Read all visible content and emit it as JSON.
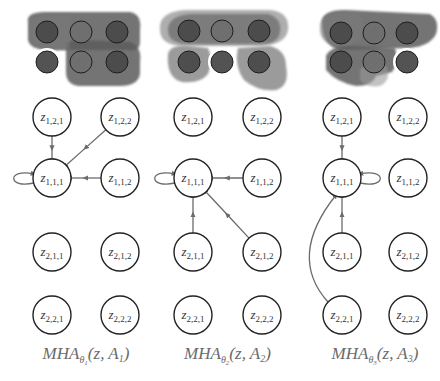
{
  "colors": {
    "blob_dark": "#5c5c5c",
    "blob_mid": "#7a7a7a",
    "blob_light": "#9a9a9a",
    "dot_dark": "#4a4a4a",
    "dot_mid": "#6f6f6f",
    "edge": "#6b6b6b",
    "node_stroke": "#222222",
    "caption": "#6a6a6a"
  },
  "panels": [
    {
      "id": "panel-1",
      "caption": {
        "base": "MHA",
        "theta_sub": "θ",
        "theta_index": "1",
        "args": "(z, A",
        "arg_index": "1",
        "close": ")"
      },
      "columns_x": [
        52,
        120
      ],
      "grid_dots": {
        "rows_y": [
          32,
          62
        ],
        "cols_x": [
          47,
          81,
          117
        ],
        "highlight": [
          [
            1,
            0
          ]
        ]
      },
      "edges": [
        {
          "from": "z_1_2_1",
          "to": "z_1_1_1"
        },
        {
          "from": "z_1_2_2",
          "to": "z_1_1_1"
        },
        {
          "from": "z_1_1_2",
          "to": "z_1_1_1"
        },
        {
          "from": "z_1_1_1",
          "to": "z_1_1_1",
          "self_loop": "left"
        }
      ]
    },
    {
      "id": "panel-2",
      "caption": {
        "base": "MHA",
        "theta_sub": "θ",
        "theta_index": "2",
        "args": "(z, A",
        "arg_index": "2",
        "close": ")"
      },
      "columns_x": [
        193,
        262
      ],
      "grid_dots": {
        "rows_y": [
          31,
          62
        ],
        "cols_x": [
          189,
          222,
          259
        ],
        "highlight": [
          [
            1,
            1
          ]
        ]
      },
      "edges": [
        {
          "from": "z_1_1_2",
          "to": "z_1_1_1"
        },
        {
          "from": "z_2_1_1",
          "to": "z_1_1_1"
        },
        {
          "from": "z_2_1_2",
          "to": "z_1_1_1"
        },
        {
          "from": "z_1_1_1",
          "to": "z_1_1_1",
          "self_loop": "left"
        }
      ]
    },
    {
      "id": "panel-3",
      "caption": {
        "base": "MHA",
        "theta_sub": "θ",
        "theta_index": "3",
        "args": "(z, A",
        "arg_index": "3",
        "close": ")"
      },
      "columns_x": [
        342,
        408
      ],
      "grid_dots": {
        "rows_y": [
          33,
          62
        ],
        "cols_x": [
          341,
          374,
          407
        ],
        "highlight": [
          [
            1,
            2
          ]
        ]
      },
      "edges": [
        {
          "from": "z_1_2_1",
          "to": "z_1_1_1"
        },
        {
          "from": "z_2_1_1",
          "to": "z_1_1_1"
        },
        {
          "from": "z_2_2_1",
          "to": "z_1_1_1",
          "curved": true
        },
        {
          "from": "z_1_1_1",
          "to": "z_1_1_1",
          "self_loop": "right"
        }
      ]
    }
  ],
  "node_rows": [
    {
      "y": 117,
      "labels": [
        {
          "id": "z_1_2_1",
          "text": "z",
          "sub": "1,2,1"
        },
        {
          "id": "z_1_2_2",
          "text": "z",
          "sub": "1,2,2"
        }
      ]
    },
    {
      "y": 178,
      "labels": [
        {
          "id": "z_1_1_1",
          "text": "z",
          "sub": "1,1,1"
        },
        {
          "id": "z_1_1_2",
          "text": "z",
          "sub": "1,1,2"
        }
      ]
    },
    {
      "y": 252,
      "labels": [
        {
          "id": "z_2_1_1",
          "text": "z",
          "sub": "2,1,1"
        },
        {
          "id": "z_2_1_2",
          "text": "z",
          "sub": "2,1,2"
        }
      ]
    },
    {
      "y": 315,
      "labels": [
        {
          "id": "z_2_2_1",
          "text": "z",
          "sub": "2,2,1"
        },
        {
          "id": "z_2_2_2",
          "text": "z",
          "sub": "2,2,2"
        }
      ]
    }
  ],
  "node_radius": 19,
  "caption_y": 359
}
